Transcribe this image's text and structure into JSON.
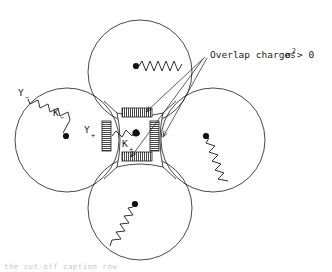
{
  "figure": {
    "background_color": "#ffffff",
    "stroke_color": "#1a1a1a",
    "annotation": {
      "text_part1": "Overlap charges ",
      "sigma": "σ",
      "exponent": "2",
      "text_part2": " > 0",
      "full_text": "Overlap charges σ2 > 0",
      "arrow_count": 3
    },
    "labels": {
      "y_minus_base": "Y",
      "y_minus_sub": "−",
      "k_minus_base": "K",
      "k_minus_sub": "−",
      "y_plus_base": "Y",
      "y_plus_sub": "+",
      "k_plus_base": "K",
      "k_plus_sub": "+"
    },
    "circles": [
      {
        "name": "top-circle",
        "cx": 140,
        "cy": 72,
        "r": 52
      },
      {
        "name": "left-circle",
        "cx": 67,
        "cy": 140,
        "r": 52
      },
      {
        "name": "right-circle",
        "cx": 213,
        "cy": 140,
        "r": 52
      },
      {
        "name": "bottom-circle",
        "cx": 140,
        "cy": 208,
        "r": 52
      }
    ],
    "nuclei": [
      {
        "name": "top-nucleus",
        "cx": 136,
        "cy": 66
      },
      {
        "name": "left-nucleus",
        "cx": 66,
        "cy": 136
      },
      {
        "name": "right-nucleus",
        "cx": 206,
        "cy": 136
      },
      {
        "name": "bottom-nucleus",
        "cx": 135,
        "cy": 204
      },
      {
        "name": "center-nucleus",
        "cx": 136,
        "cy": 133
      }
    ],
    "overlap_charges": [
      {
        "name": "overlap-top",
        "orientation": "horizontal"
      },
      {
        "name": "overlap-left",
        "orientation": "vertical"
      },
      {
        "name": "overlap-right",
        "orientation": "vertical"
      },
      {
        "name": "overlap-bottom",
        "orientation": "horizontal"
      }
    ],
    "bottom_caption": "the cut-off caption row"
  }
}
